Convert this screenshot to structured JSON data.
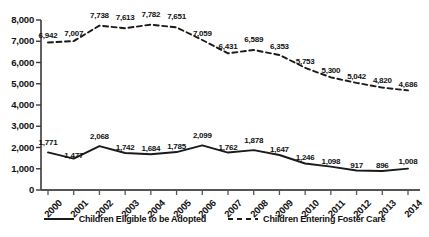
{
  "chart_data": {
    "type": "line",
    "title": "",
    "xlabel": "",
    "ylabel": "",
    "categories": [
      "2000",
      "2001",
      "2002",
      "2003",
      "2004",
      "2005",
      "2006",
      "2007",
      "2008",
      "2009",
      "2010",
      "2011",
      "2012",
      "2013",
      "2014"
    ],
    "ylim": [
      0,
      8000
    ],
    "ytick_values": [
      0,
      1000,
      2000,
      3000,
      4000,
      5000,
      6000,
      7000,
      8000
    ],
    "ytick_labels": [
      "0",
      "1,000",
      "2,000",
      "3,000",
      "4,000",
      "5,000",
      "6,000",
      "7,000",
      "8,000"
    ],
    "grid": false,
    "legend_position": "bottom",
    "series": [
      {
        "name": "Children Eligible to be Adopted",
        "style": "solid",
        "color": "#1a1a1a",
        "values": [
          1771,
          1477,
          2068,
          1742,
          1684,
          1785,
          2099,
          1762,
          1878,
          1647,
          1246,
          1098,
          917,
          896,
          1008
        ],
        "labels": [
          "1,771",
          "1,477",
          "2,068",
          "1,742",
          "1,684",
          "1,785",
          "2,099",
          "1,762",
          "1,878",
          "1,647",
          "1,246",
          "1,098",
          "917",
          "896",
          "1,008"
        ]
      },
      {
        "name": "Children Entering Foster Care",
        "style": "dashed",
        "color": "#1a1a1a",
        "values": [
          6942,
          7007,
          7738,
          7613,
          7782,
          7651,
          7059,
          6431,
          6589,
          6353,
          5753,
          5300,
          5042,
          4820,
          4686
        ],
        "labels": [
          "6,942",
          "7,007",
          "7,738",
          "7,613",
          "7,782",
          "7,651",
          "7,059",
          "6,431",
          "6,589",
          "6,353",
          "5,753",
          "5,300",
          "5,042",
          "4,820",
          "4,686"
        ]
      }
    ]
  },
  "legend": {
    "items": [
      {
        "label": "Children Eligible to be Adopted",
        "style": "solid"
      },
      {
        "label": "Children Entering Foster Care",
        "style": "dashed"
      }
    ]
  }
}
